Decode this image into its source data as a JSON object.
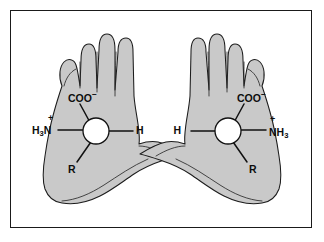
{
  "figure": {
    "frame": {
      "border_color": "#1a1a1a",
      "background_color": "#ffffff"
    },
    "colors": {
      "hand_fill": "#c9c9c9",
      "outline": "#1c1c1c",
      "bond": "#111111",
      "alpha_carbon_fill": "#ffffff",
      "label_text": "#0d0d0d"
    }
  },
  "left_molecule": {
    "name": "left-hand-enantiomer",
    "hand": "left",
    "alpha_carbon_label": "",
    "substituents": [
      {
        "key": "carboxylate",
        "text": "COO",
        "charge": "−",
        "position": "upper-left"
      },
      {
        "key": "ammonium",
        "text": "N",
        "sub": "3",
        "prefix": "H",
        "charge": "+",
        "position": "left"
      },
      {
        "key": "hydrogen",
        "text": "H",
        "position": "right"
      },
      {
        "key": "side_chain",
        "text": "R",
        "position": "lower-left"
      }
    ],
    "labels": {
      "carboxylate_main": "COO",
      "carboxylate_charge": "−",
      "ammonium_h": "H",
      "ammonium_h_sub": "3",
      "ammonium_n": "N",
      "ammonium_charge": "+",
      "hydrogen": "H",
      "side_chain": "R"
    }
  },
  "right_molecule": {
    "name": "right-hand-enantiomer",
    "hand": "right",
    "alpha_carbon_label": "",
    "substituents": [
      {
        "key": "carboxylate",
        "text": "COO",
        "charge": "−",
        "position": "upper-right"
      },
      {
        "key": "ammonium",
        "text": "NH",
        "sub": "3",
        "charge": "+",
        "position": "right"
      },
      {
        "key": "hydrogen",
        "text": "H",
        "position": "left"
      },
      {
        "key": "side_chain",
        "text": "R",
        "position": "lower-right"
      }
    ],
    "labels": {
      "carboxylate_main": "COO",
      "carboxylate_charge": "−",
      "ammonium_n": "N",
      "ammonium_h": "H",
      "ammonium_h_sub": "3",
      "ammonium_charge": "+",
      "hydrogen": "H",
      "side_chain": "R"
    }
  }
}
